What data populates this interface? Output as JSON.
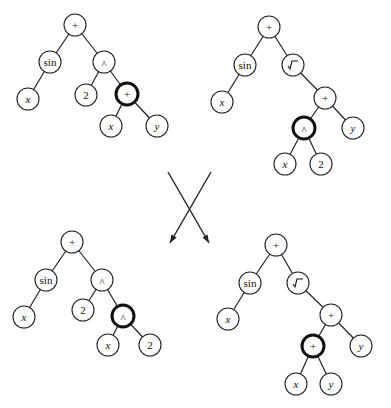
{
  "figure": {
    "node_radius": 11,
    "colors": {
      "stroke": "#222222",
      "background": "#ffffff",
      "highlight_stroke": "#111111"
    }
  },
  "trees": [
    {
      "id": "parent-1",
      "expression": "sin(x) + 2^(x+y)",
      "nodes": [
        {
          "id": "a0",
          "label": "+",
          "x": 75,
          "y": 25
        },
        {
          "id": "a1",
          "label": "sin",
          "x": 50,
          "y": 62
        },
        {
          "id": "a2",
          "label": "^",
          "x": 104,
          "y": 62
        },
        {
          "id": "a3",
          "label": "x",
          "x": 28,
          "y": 99,
          "var": true
        },
        {
          "id": "a4",
          "label": "2",
          "x": 86,
          "y": 95
        },
        {
          "id": "a5",
          "label": "+",
          "x": 127,
          "y": 94,
          "highlight": true
        },
        {
          "id": "a6",
          "label": "x",
          "x": 111,
          "y": 126,
          "var": true
        },
        {
          "id": "a7",
          "label": "y",
          "x": 157,
          "y": 126,
          "var": true
        }
      ],
      "edges": [
        [
          "a0",
          "a1"
        ],
        [
          "a0",
          "a2"
        ],
        [
          "a1",
          "a3"
        ],
        [
          "a2",
          "a4"
        ],
        [
          "a2",
          "a5"
        ],
        [
          "a5",
          "a6"
        ],
        [
          "a5",
          "a7"
        ]
      ]
    },
    {
      "id": "parent-2",
      "expression": "sin(x) + sqrt(x^2 + y)",
      "nodes": [
        {
          "id": "b0",
          "label": "+",
          "x": 269,
          "y": 27
        },
        {
          "id": "b1",
          "label": "sin",
          "x": 245,
          "y": 65
        },
        {
          "id": "b2",
          "label": "√",
          "x": 293,
          "y": 65
        },
        {
          "id": "b3",
          "label": "x",
          "x": 222,
          "y": 102,
          "var": true
        },
        {
          "id": "b4",
          "label": "+",
          "x": 325,
          "y": 98
        },
        {
          "id": "b5",
          "label": "^",
          "x": 304,
          "y": 128,
          "highlight": true
        },
        {
          "id": "b6",
          "label": "y",
          "x": 353,
          "y": 128,
          "var": true
        },
        {
          "id": "b7",
          "label": "x",
          "x": 285,
          "y": 164,
          "var": true
        },
        {
          "id": "b8",
          "label": "2",
          "x": 321,
          "y": 164
        }
      ],
      "edges": [
        [
          "b0",
          "b1"
        ],
        [
          "b0",
          "b2"
        ],
        [
          "b1",
          "b3"
        ],
        [
          "b2",
          "b4"
        ],
        [
          "b4",
          "b5"
        ],
        [
          "b4",
          "b6"
        ],
        [
          "b5",
          "b7"
        ],
        [
          "b5",
          "b8"
        ]
      ]
    },
    {
      "id": "offspring-1",
      "expression": "sin(x) + 2^(x^2)",
      "nodes": [
        {
          "id": "c0",
          "label": "+",
          "x": 72,
          "y": 242
        },
        {
          "id": "c1",
          "label": "sin",
          "x": 46,
          "y": 280
        },
        {
          "id": "c2",
          "label": "^",
          "x": 102,
          "y": 280
        },
        {
          "id": "c3",
          "label": "x",
          "x": 24,
          "y": 317,
          "var": true
        },
        {
          "id": "c4",
          "label": "2",
          "x": 83,
          "y": 310
        },
        {
          "id": "c5",
          "label": "^",
          "x": 123,
          "y": 316,
          "highlight": true
        },
        {
          "id": "c6",
          "label": "x",
          "x": 108,
          "y": 345,
          "var": true
        },
        {
          "id": "c7",
          "label": "2",
          "x": 150,
          "y": 345
        }
      ],
      "edges": [
        [
          "c0",
          "c1"
        ],
        [
          "c0",
          "c2"
        ],
        [
          "c1",
          "c3"
        ],
        [
          "c2",
          "c4"
        ],
        [
          "c2",
          "c5"
        ],
        [
          "c5",
          "c6"
        ],
        [
          "c5",
          "c7"
        ]
      ]
    },
    {
      "id": "offspring-2",
      "expression": "sin(x) + sqrt((x+y) + y)",
      "nodes": [
        {
          "id": "d0",
          "label": "+",
          "x": 276,
          "y": 245
        },
        {
          "id": "d1",
          "label": "sin",
          "x": 250,
          "y": 283
        },
        {
          "id": "d2",
          "label": "√",
          "x": 298,
          "y": 283
        },
        {
          "id": "d3",
          "label": "x",
          "x": 228,
          "y": 319,
          "var": true
        },
        {
          "id": "d4",
          "label": "+",
          "x": 331,
          "y": 315
        },
        {
          "id": "d5",
          "label": "+",
          "x": 313,
          "y": 346,
          "highlight": true
        },
        {
          "id": "d6",
          "label": "y",
          "x": 361,
          "y": 346,
          "var": true
        },
        {
          "id": "d7",
          "label": "x",
          "x": 296,
          "y": 384,
          "var": true
        },
        {
          "id": "d8",
          "label": "y",
          "x": 331,
          "y": 384,
          "var": true
        }
      ],
      "edges": [
        [
          "d0",
          "d1"
        ],
        [
          "d0",
          "d2"
        ],
        [
          "d1",
          "d3"
        ],
        [
          "d2",
          "d4"
        ],
        [
          "d4",
          "d5"
        ],
        [
          "d4",
          "d6"
        ],
        [
          "d5",
          "d7"
        ],
        [
          "d5",
          "d8"
        ]
      ]
    }
  ],
  "crossover_arrows": [
    {
      "id": "arrow-left",
      "x1": 211,
      "y1": 172,
      "x2": 170,
      "y2": 243
    },
    {
      "id": "arrow-right",
      "x1": 168,
      "y1": 172,
      "x2": 209,
      "y2": 243
    }
  ]
}
